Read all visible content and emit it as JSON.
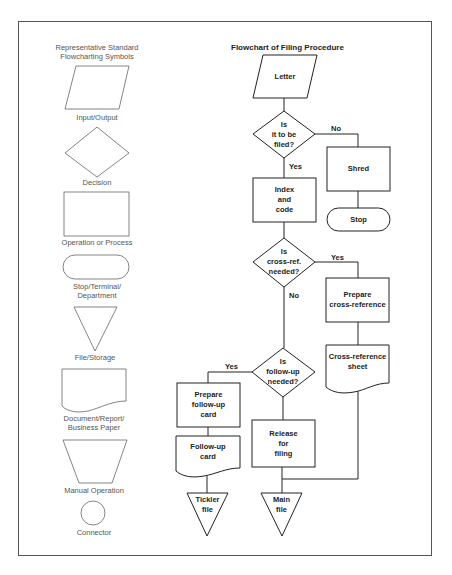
{
  "legend": {
    "title_line1": "Representative Standard",
    "title_line2": "Flowcharting Symbols",
    "symbols": [
      {
        "shape": "parallelogram",
        "label_line1": "Input/Output",
        "label_line2": ""
      },
      {
        "shape": "diamond",
        "label_line1": "Decision",
        "label_line2": ""
      },
      {
        "shape": "rectangle",
        "label_line1": "Operation or Process",
        "label_line2": ""
      },
      {
        "shape": "terminal",
        "label_line1": "Stop/Terminal/",
        "label_line2": "Department"
      },
      {
        "shape": "triangle",
        "label_line1": "File/Storage",
        "label_line2": ""
      },
      {
        "shape": "document",
        "label_line1": "Document/Report/",
        "label_line2": "Business Paper"
      },
      {
        "shape": "trapezoid",
        "label_line1": "Manual Operation",
        "label_line2": ""
      },
      {
        "shape": "circle",
        "label_line1": "Connector",
        "label_line2": ""
      }
    ]
  },
  "flowchart": {
    "title": "Flowchart of Filing Procedure",
    "nodes": {
      "letter": {
        "shape": "parallelogram",
        "lines": [
          "Letter"
        ]
      },
      "filed_decision": {
        "shape": "diamond",
        "lines": [
          "Is",
          "it to be",
          "filed?"
        ]
      },
      "shred": {
        "shape": "rectangle",
        "lines": [
          "Shred"
        ]
      },
      "stop": {
        "shape": "terminal",
        "lines": [
          "Stop"
        ]
      },
      "index_code": {
        "shape": "rectangle",
        "lines": [
          "Index",
          "and",
          "code"
        ]
      },
      "crossref_decision": {
        "shape": "diamond",
        "lines": [
          "Is",
          "cross-ref.",
          "needed?"
        ]
      },
      "prepare_crossref": {
        "shape": "rectangle",
        "lines": [
          "Prepare",
          "cross-reference"
        ]
      },
      "crossref_sheet": {
        "shape": "document",
        "lines": [
          "Cross-reference",
          "sheet"
        ]
      },
      "followup_decision": {
        "shape": "diamond",
        "lines": [
          "Is",
          "follow-up",
          "needed?"
        ]
      },
      "prepare_followup": {
        "shape": "rectangle",
        "lines": [
          "Prepare",
          "follow-up",
          "card"
        ]
      },
      "followup_card": {
        "shape": "document",
        "lines": [
          "Follow-up",
          "card"
        ]
      },
      "release_filing": {
        "shape": "rectangle",
        "lines": [
          "Release",
          "for",
          "filing"
        ]
      },
      "tickler_file": {
        "shape": "triangle",
        "lines": [
          "Tickler",
          "file"
        ]
      },
      "main_file": {
        "shape": "triangle",
        "lines": [
          "Main",
          "file"
        ]
      }
    },
    "edges": {
      "filed_no": "No",
      "filed_yes": "Yes",
      "crossref_yes": "Yes",
      "crossref_no": "No",
      "followup_yes": "Yes"
    }
  },
  "colors": {
    "legend_stroke": "#666666",
    "chart_stroke": "#222222",
    "frame": "#555555"
  }
}
